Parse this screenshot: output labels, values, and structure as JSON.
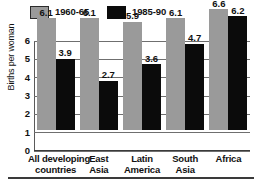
{
  "chart_data": {
    "type": "bar",
    "title": "",
    "subtitle": "",
    "xlabel": "",
    "ylabel": "Births per woman",
    "ylim": [
      0,
      6
    ],
    "yticks": [
      "0",
      "1",
      "2",
      "3",
      "4",
      "5",
      "6"
    ],
    "grid": true,
    "legend_position": "top-left",
    "categories": [
      "All developing countries",
      "East Asia",
      "Latin America",
      "South Asia",
      "Africa"
    ],
    "category_lines": [
      [
        "All developing",
        "countries"
      ],
      [
        "East",
        "Asia"
      ],
      [
        "Latin",
        "America"
      ],
      [
        "South",
        "Asia"
      ],
      [
        "Africa"
      ]
    ],
    "series": [
      {
        "name": "1960-65",
        "color": "#9a9a9a",
        "values": [
          6.1,
          6.1,
          5.9,
          6.1,
          6.6
        ],
        "labels": [
          "6.1",
          "6.1",
          "5.9",
          "6.1",
          "6.6"
        ]
      },
      {
        "name": "1985-90",
        "color": "#0b0b0b",
        "values": [
          3.9,
          2.7,
          3.6,
          4.7,
          6.2
        ],
        "labels": [
          "3.9",
          "2.7",
          "3.6",
          "4.7",
          "6.2"
        ]
      }
    ]
  },
  "legend": {
    "items": [
      {
        "label": "1960-65",
        "swatch": "gray"
      },
      {
        "label": "1985-90",
        "swatch": "black"
      }
    ]
  },
  "colors": {
    "series_1960_65": "#9a9a9a",
    "series_1985_90": "#0b0b0b",
    "gridline": "#6f6f6f",
    "axis": "#3a3a3a",
    "background": "#ffffff",
    "text": "#111111"
  }
}
